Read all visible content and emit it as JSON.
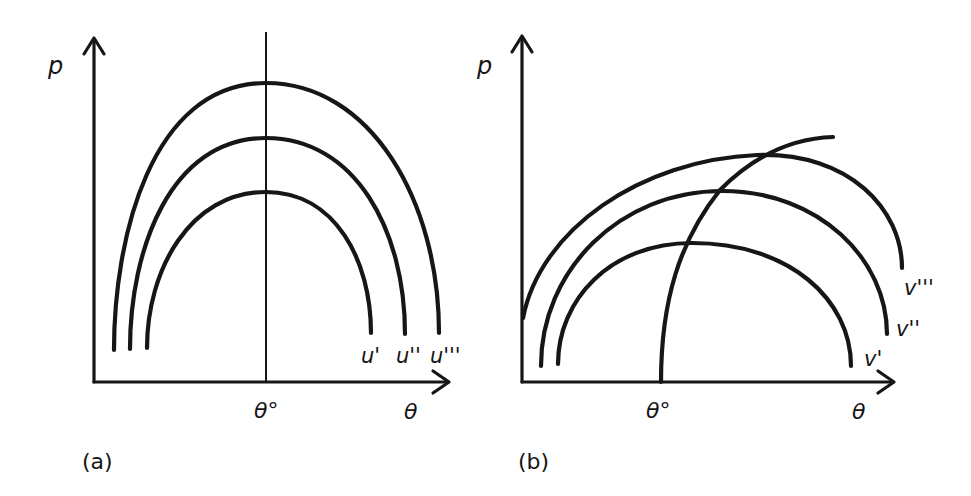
{
  "figure": {
    "panels": [
      {
        "id": "a",
        "caption": "(a)",
        "y_axis_label": "p",
        "x_axis_label": "θ",
        "reference_label": "θ°",
        "curves": [
          {
            "label": "u'"
          },
          {
            "label": "u''"
          },
          {
            "label": "u'''"
          }
        ]
      },
      {
        "id": "b",
        "caption": "(b)",
        "y_axis_label": "p",
        "x_axis_label": "θ",
        "reference_label": "θ°",
        "curves": [
          {
            "label": "v'"
          },
          {
            "label": "v''"
          },
          {
            "label": "v'''"
          }
        ]
      }
    ]
  },
  "colors": {
    "ink": "#161616",
    "background": "#ffffff"
  }
}
